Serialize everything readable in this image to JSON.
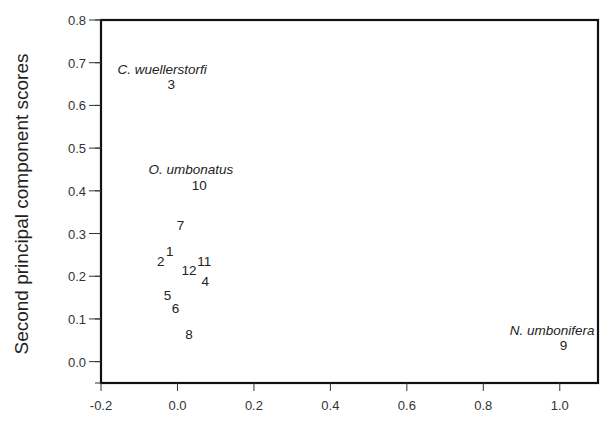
{
  "chart_data": {
    "type": "scatter",
    "title": "",
    "xlabel": "",
    "ylabel": "Second principal component scores",
    "xlim": [
      -0.2,
      1.1
    ],
    "ylim": [
      -0.05,
      0.8
    ],
    "x_ticks": [
      "-0.2",
      "0.0",
      "0.2",
      "0.4",
      "0.6",
      "0.8",
      "1.0"
    ],
    "x_tick_values": [
      -0.2,
      0.0,
      0.2,
      0.4,
      0.6,
      0.8,
      1.0
    ],
    "y_ticks": [
      "0.0",
      "0.1",
      "0.2",
      "0.3",
      "0.4",
      "0.5",
      "0.6",
      "0.7",
      "0.8"
    ],
    "y_tick_values": [
      0.0,
      0.1,
      0.2,
      0.3,
      0.4,
      0.5,
      0.6,
      0.7,
      0.8
    ],
    "y_minor_step": 0.05,
    "grid": false,
    "legend": null,
    "points": [
      {
        "label": "1",
        "x": -0.02,
        "y": 0.26
      },
      {
        "label": "2",
        "x": -0.044,
        "y": 0.235
      },
      {
        "label": "3",
        "x": -0.016,
        "y": 0.649
      },
      {
        "label": "4",
        "x": 0.073,
        "y": 0.19
      },
      {
        "label": "5",
        "x": -0.026,
        "y": 0.156
      },
      {
        "label": "6",
        "x": -0.005,
        "y": 0.126
      },
      {
        "label": "7",
        "x": 0.008,
        "y": 0.32
      },
      {
        "label": "8",
        "x": 0.03,
        "y": 0.065
      },
      {
        "label": "9",
        "x": 1.01,
        "y": 0.04
      },
      {
        "label": "10",
        "x": 0.057,
        "y": 0.414
      },
      {
        "label": "11",
        "x": 0.07,
        "y": 0.235
      },
      {
        "label": "12",
        "x": 0.03,
        "y": 0.215
      }
    ],
    "annotations": [
      {
        "text": "C. wuellerstorfi",
        "x": -0.04,
        "y": 0.685,
        "italic": true
      },
      {
        "text": "O. umbonatus",
        "x": 0.035,
        "y": 0.45,
        "italic": true
      },
      {
        "text": "N. umbonifera",
        "x": 0.98,
        "y": 0.075,
        "italic": true
      }
    ]
  }
}
